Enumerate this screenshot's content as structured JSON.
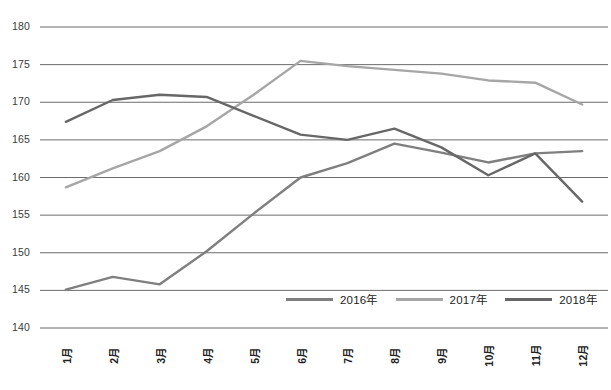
{
  "chart_data": {
    "type": "line",
    "title": "",
    "xlabel": "",
    "ylabel": "",
    "ylim": [
      140,
      180
    ],
    "yticks": [
      140,
      145,
      150,
      155,
      160,
      165,
      170,
      175,
      180
    ],
    "grid": true,
    "legend_position": "bottom-center",
    "categories": [
      "1月",
      "2月",
      "3月",
      "4月",
      "5月",
      "6月",
      "7月",
      "8月",
      "9月",
      "10月",
      "11月",
      "12月"
    ],
    "series": [
      {
        "name": "2016年",
        "color": "#7f7f7f",
        "values": [
          145.1,
          146.8,
          145.8,
          150.2,
          155.2,
          160.0,
          161.9,
          164.5,
          163.3,
          162.0,
          163.2,
          163.5
        ]
      },
      {
        "name": "2017年",
        "color": "#a6a6a6",
        "values": [
          158.7,
          161.2,
          163.5,
          166.8,
          171.0,
          175.5,
          174.8,
          174.3,
          173.8,
          172.9,
          172.6,
          169.7
        ]
      },
      {
        "name": "2018年",
        "color": "#676767",
        "values": [
          167.4,
          170.3,
          171.0,
          170.7,
          168.2,
          165.7,
          165.0,
          166.5,
          164.0,
          160.3,
          163.2,
          156.8
        ]
      }
    ]
  },
  "axis": {
    "y_labels": [
      "180",
      "175",
      "170",
      "165",
      "160",
      "155",
      "150",
      "145",
      "140"
    ],
    "x_labels": [
      "1月",
      "2月",
      "3月",
      "4月",
      "5月",
      "6月",
      "7月",
      "8月",
      "9月",
      "10月",
      "11月",
      "12月"
    ]
  },
  "legend": {
    "items": [
      {
        "label": "2016年",
        "color": "#7f7f7f"
      },
      {
        "label": "2017年",
        "color": "#a6a6a6"
      },
      {
        "label": "2018年",
        "color": "#676767"
      }
    ]
  },
  "caption": {
    "text": ""
  },
  "colors": {
    "gridline": "#5a5a5a",
    "background": "#ffffff",
    "tick_text": "#3b3b3b"
  }
}
